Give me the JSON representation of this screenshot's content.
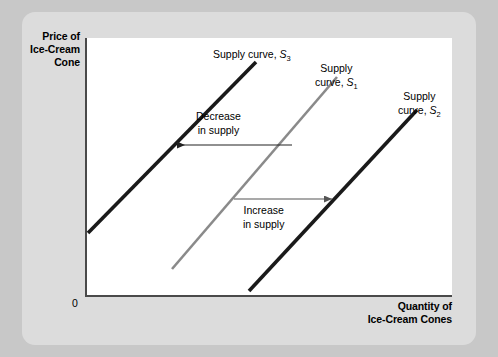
{
  "figure": {
    "background_color": "#c8c8c8",
    "card_color": "#dcdcdc",
    "plot_color": "#ffffff"
  },
  "axes": {
    "y_title_lines": [
      "Price of",
      "Ice-Cream",
      "Cone"
    ],
    "y_title": "Price of Ice-Cream Cone",
    "x_title_lines": [
      "Quantity of",
      "Ice-Cream Cones"
    ],
    "x_title": "Quantity of Ice-Cream Cones",
    "origin_label": "0",
    "axis_color": "#4a4a4a"
  },
  "curves": [
    {
      "id": "S3",
      "label_line1": "Supply curve, ",
      "label_var": "S",
      "label_sub": "3",
      "label_full": "Supply curve, S3",
      "color": "#1a1a1a",
      "x1": 88,
      "y1": 233,
      "x2": 256,
      "y2": 62
    },
    {
      "id": "S1",
      "label_line1": "Supply",
      "label_line2": "curve, ",
      "label_var": "S",
      "label_sub": "1",
      "label_full": "Supply curve, S1",
      "color": "#8a8a8a",
      "x1": 172,
      "y1": 269,
      "x2": 337,
      "y2": 77
    },
    {
      "id": "S2",
      "label_line1": "Supply",
      "label_line2": "curve, ",
      "label_var": "S",
      "label_sub": "2",
      "label_full": "Supply curve, S2",
      "color": "#1a1a1a",
      "x1": 249,
      "y1": 291,
      "x2": 417,
      "y2": 110
    }
  ],
  "annotations": [
    {
      "id": "decrease",
      "line1": "Decrease",
      "line2": "in supply",
      "text": "Decrease in supply",
      "arrow_direction": "left",
      "arrow_color": "#222222",
      "x_from": 292,
      "x_to": 177,
      "y": 145
    },
    {
      "id": "increase",
      "line1": "Increase",
      "line2": "in supply",
      "text": "Increase in supply",
      "arrow_direction": "right",
      "arrow_color": "#555555",
      "x_from": 234,
      "x_to": 332,
      "y": 199
    }
  ]
}
